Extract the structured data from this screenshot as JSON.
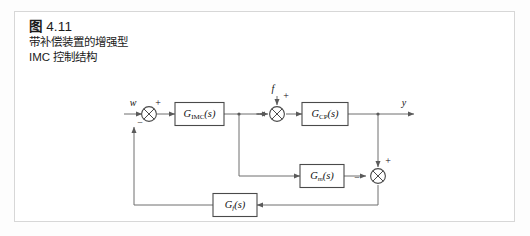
{
  "figure": {
    "caption_number": "图 4.11",
    "caption_fig_word": "图",
    "caption_number_value": "4.11",
    "caption_line_1": "带补偿装置的增强型",
    "caption_line_2": "IMC 控制结构"
  },
  "diagram": {
    "type": "control-block-diagram",
    "blocks": [
      {
        "id": "gimc",
        "label_main": "G",
        "label_sub": "IMC",
        "label_arg": "(s)"
      },
      {
        "id": "gcp",
        "label_main": "G",
        "label_sub": "CP",
        "label_arg": "(s)"
      },
      {
        "id": "gm",
        "label_main": "G",
        "label_sub": "m",
        "label_arg": "(s)"
      },
      {
        "id": "gf",
        "label_main": "G",
        "label_sub": "f",
        "label_arg": "(s)"
      }
    ],
    "signals": {
      "reference": "w",
      "disturbance": "f",
      "output": "y"
    },
    "signs": {
      "input_sum_top": "+",
      "input_sum_left": "−",
      "input_sum_bottom": "−",
      "disturbance_sum_top": "+",
      "right_sum_top": "+",
      "right_sum_left": "−"
    },
    "colors": {
      "line": "#6e6e6e",
      "block_stroke": "#4a4a4a",
      "frame": "#d7d7d7",
      "text": "#111111"
    }
  }
}
